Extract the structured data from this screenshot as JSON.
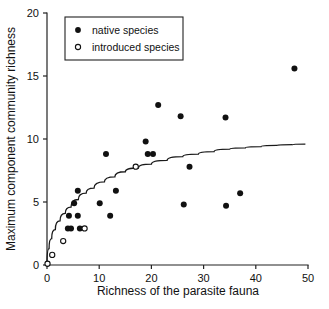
{
  "chart_data": {
    "type": "scatter",
    "title": "",
    "xlabel": "Richness of the parasite fauna",
    "ylabel": "Maximum component community richness",
    "xlim": [
      0,
      50
    ],
    "ylim": [
      0,
      20
    ],
    "xticks": [
      0,
      10,
      20,
      30,
      40,
      50
    ],
    "yticks": [
      0,
      5,
      10,
      15,
      20
    ],
    "xtick_labels": [
      "0",
      "10",
      "20",
      "30",
      "40",
      "50"
    ],
    "ytick_labels": [
      "0",
      "5",
      "10",
      "15",
      "20"
    ],
    "grid": false,
    "legend_position": "top-left",
    "series": [
      {
        "name": "native species",
        "marker": "filled-circle",
        "color": "#111111",
        "points": [
          [
            4.2,
            3.9
          ],
          [
            4.0,
            2.9
          ],
          [
            4.6,
            2.9
          ],
          [
            5.2,
            4.9
          ],
          [
            5.9,
            5.9
          ],
          [
            5.9,
            3.9
          ],
          [
            6.3,
            2.9
          ],
          [
            10.1,
            4.9
          ],
          [
            11.3,
            8.8
          ],
          [
            12.1,
            3.9
          ],
          [
            13.2,
            5.9
          ],
          [
            18.9,
            9.8
          ],
          [
            19.3,
            8.8
          ],
          [
            20.3,
            8.8
          ],
          [
            21.3,
            12.7
          ],
          [
            25.6,
            11.8
          ],
          [
            26.2,
            4.8
          ],
          [
            27.3,
            7.8
          ],
          [
            34.2,
            11.7
          ],
          [
            34.3,
            4.7
          ],
          [
            37.0,
            5.7
          ],
          [
            47.4,
            15.6
          ]
        ]
      },
      {
        "name": "introduced species",
        "marker": "open-circle",
        "color": "#111111",
        "points": [
          [
            0.1,
            0.1
          ],
          [
            1.0,
            0.8
          ],
          [
            3.1,
            1.9
          ],
          [
            7.2,
            2.9
          ],
          [
            17.0,
            7.8
          ]
        ]
      }
    ],
    "fit_curve": {
      "name": "fitted saturating curve",
      "description": "asymptotic curve rising from origin toward ~9.6",
      "asymptote": 9.6,
      "points": [
        [
          0.0,
          0.0
        ],
        [
          0.4,
          1.3
        ],
        [
          0.9,
          2.1
        ],
        [
          1.6,
          2.8
        ],
        [
          2.5,
          3.5
        ],
        [
          3.5,
          4.1
        ],
        [
          4.6,
          4.6
        ],
        [
          6.0,
          5.2
        ],
        [
          7.5,
          5.7
        ],
        [
          9.0,
          6.1
        ],
        [
          11.0,
          6.6
        ],
        [
          13.0,
          7.0
        ],
        [
          15.0,
          7.4
        ],
        [
          17.5,
          7.7
        ],
        [
          20.0,
          8.0
        ],
        [
          23.0,
          8.3
        ],
        [
          26.0,
          8.6
        ],
        [
          29.0,
          8.8
        ],
        [
          32.0,
          9.0
        ],
        [
          35.0,
          9.2
        ],
        [
          38.0,
          9.3
        ],
        [
          41.0,
          9.4
        ],
        [
          44.0,
          9.5
        ],
        [
          47.0,
          9.55
        ],
        [
          49.5,
          9.6
        ]
      ]
    }
  },
  "legend": {
    "entries": [
      {
        "label": "native species"
      },
      {
        "label": "introduced species"
      }
    ]
  }
}
